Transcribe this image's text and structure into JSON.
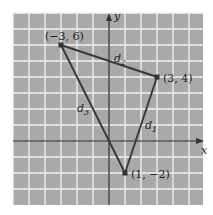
{
  "figure": {
    "axes": {
      "x_label": "x",
      "y_label": "y"
    },
    "grid": {
      "x_min": -6,
      "x_max": 6,
      "y_min": -4,
      "y_max": 8,
      "background": "#a9a9a9",
      "line_color": "#f2f2f2"
    },
    "points": [
      {
        "label": "(−3, 6)",
        "x": -3,
        "y": 6
      },
      {
        "label": "(3, 4)",
        "x": 3,
        "y": 4
      },
      {
        "label": "(1, −2)",
        "x": 1,
        "y": -2
      }
    ],
    "segments": [
      {
        "label": "d",
        "sub": "1",
        "from": "(3, 4)",
        "to": "(1, −2)"
      },
      {
        "label": "d",
        "sub": "2",
        "from": "(−3, 6)",
        "to": "(3, 4)"
      },
      {
        "label": "d",
        "sub": "3",
        "from": "(−3, 6)",
        "to": "(1, −2)"
      }
    ],
    "line_color": "#3a3a3a"
  }
}
